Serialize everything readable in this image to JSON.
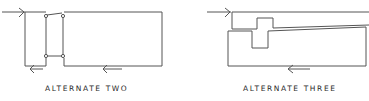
{
  "diagrams": [
    {
      "id": "alt-two",
      "caption": "ALTERNATE TWO"
    },
    {
      "id": "alt-three",
      "caption": "ALTERNATE THREE"
    }
  ],
  "colors": {
    "stroke": "#555555",
    "text": "#2a2a2a",
    "background": "#ffffff"
  }
}
